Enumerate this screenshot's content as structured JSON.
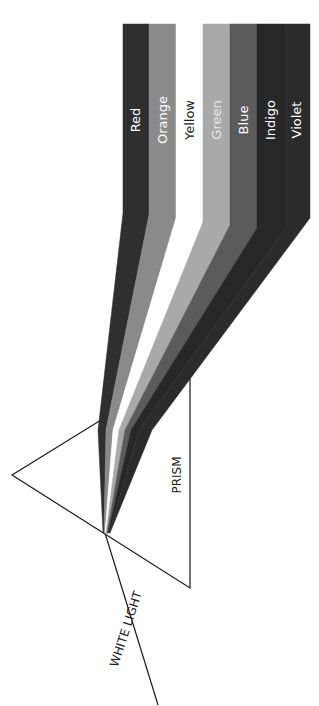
{
  "diagram": {
    "prism_label": "PRISM",
    "input_label": "WHITE LIGHT",
    "bands": [
      {
        "name": "Red",
        "color": "#2f2f2f",
        "text_color": "#ffffff"
      },
      {
        "name": "Orange",
        "color": "#8a8a8a",
        "text_color": "#ffffff"
      },
      {
        "name": "Yellow",
        "color": "#ffffff",
        "text_color": "#222222"
      },
      {
        "name": "Green",
        "color": "#a9a9a9",
        "text_color": "#e8e8e8"
      },
      {
        "name": "Blue",
        "color": "#5b5b5b",
        "text_color": "#ffffff"
      },
      {
        "name": "Indigo",
        "color": "#272727",
        "text_color": "#ffffff"
      },
      {
        "name": "Violet",
        "color": "#2b2b2b",
        "text_color": "#ffffff"
      }
    ],
    "line_color": "#1a1a1a"
  }
}
